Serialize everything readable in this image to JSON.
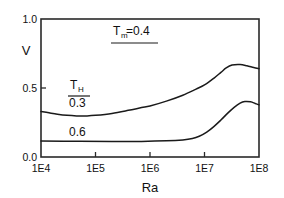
{
  "chart_data": {
    "type": "line",
    "title": "",
    "xlabel": "Ra",
    "ylabel": "V",
    "xscale": "log",
    "xlim": [
      10000,
      100000000
    ],
    "ylim": [
      0.0,
      1.0
    ],
    "grid": false,
    "legend_position": "inside-left",
    "xticks": [
      "1E4",
      "1E5",
      "1E6",
      "1E7",
      "1E8"
    ],
    "xtick_values": [
      10000,
      100000,
      1000000,
      10000000,
      100000000
    ],
    "yticks": [
      "0.0",
      "0.5",
      "1.0"
    ],
    "ytick_values": [
      0.0,
      0.5,
      1.0
    ],
    "annotations": [
      {
        "name": "parameter-Tm",
        "base": "T",
        "sub": "m",
        "rest": "=0.4",
        "underlined": true
      },
      {
        "name": "legend-header-TH",
        "base": "T",
        "sub": "H",
        "rest": "",
        "underlined": true
      }
    ],
    "series": [
      {
        "name": "0.3",
        "label": "0.3",
        "color": "#1a1a1a",
        "x": [
          10000,
          14000,
          20000,
          30000,
          45000,
          70000,
          100000,
          200000,
          400000,
          700000,
          1000000,
          2000000,
          4000000,
          7000000,
          10000000,
          15000000,
          20000000,
          25000000,
          32000000,
          45000000,
          60000000,
          80000000,
          100000000
        ],
        "y": [
          0.33,
          0.32,
          0.31,
          0.302,
          0.298,
          0.298,
          0.302,
          0.316,
          0.338,
          0.358,
          0.37,
          0.405,
          0.448,
          0.492,
          0.522,
          0.572,
          0.613,
          0.645,
          0.666,
          0.67,
          0.661,
          0.648,
          0.64
        ]
      },
      {
        "name": "0.6",
        "label": "0.6",
        "color": "#1a1a1a",
        "x": [
          10000,
          50000,
          200000,
          700000,
          2000000,
          4000000,
          6000000,
          8000000,
          11000000,
          15000000,
          20000000,
          27000000,
          35000000,
          45000000,
          55000000,
          70000000,
          85000000,
          100000000
        ],
        "y": [
          0.116,
          0.114,
          0.113,
          0.113,
          0.117,
          0.124,
          0.134,
          0.15,
          0.18,
          0.222,
          0.268,
          0.32,
          0.36,
          0.39,
          0.402,
          0.4,
          0.388,
          0.378
        ]
      }
    ]
  },
  "labels": {
    "y_axis_title": "V",
    "x_axis_title": "Ra"
  }
}
